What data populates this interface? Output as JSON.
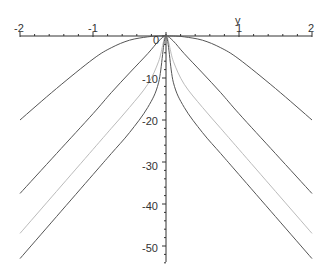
{
  "chart_data": {
    "type": "line",
    "title": "",
    "xlabel": "",
    "ylabel": "y",
    "xlim": [
      -2,
      2
    ],
    "ylim": [
      -53,
      1
    ],
    "x_ticks": [
      "-2",
      "-1",
      "1",
      "2"
    ],
    "y_ticks": [
      "0",
      "-10",
      "-20",
      "-30",
      "-40",
      "-50"
    ],
    "grid": false,
    "legend": null,
    "x": [
      -2,
      -1.5,
      -1,
      -0.75,
      -0.5,
      -0.25,
      -0.1,
      0,
      0.1,
      0.25,
      0.5,
      0.75,
      1,
      1.5,
      2
    ],
    "series": [
      {
        "name": "curve-1",
        "color": "#555555",
        "values": [
          -20,
          -12.5,
          -5.5,
          -2.8,
          -1.0,
          -0.2,
          0,
          0,
          0,
          -0.2,
          -1.0,
          -2.8,
          -5.5,
          -12.5,
          -20
        ]
      },
      {
        "name": "curve-2",
        "color": "#555555",
        "values": [
          -37.5,
          -28,
          -18.5,
          -13.5,
          -8.8,
          -4.2,
          -1.2,
          0,
          -1.2,
          -4.2,
          -8.8,
          -13.5,
          -18.5,
          -28,
          -37.5
        ]
      },
      {
        "name": "curve-3",
        "color": "#bbbbbb",
        "values": [
          -47,
          -37,
          -27,
          -22,
          -17,
          -11.5,
          -6,
          0,
          -6,
          -11.5,
          -17,
          -22,
          -27,
          -37,
          -47
        ]
      },
      {
        "name": "curve-4",
        "color": "#555555",
        "values": [
          -53,
          -43,
          -33,
          -28,
          -23,
          -17,
          -11,
          0,
          -11,
          -17,
          -23,
          -28,
          -33,
          -43,
          -53
        ]
      }
    ]
  },
  "labels": {
    "x_minus2": "-2",
    "x_minus1": "-1",
    "x_1": "1",
    "x_2": "2",
    "y_axis_name": "y",
    "y_0": "0",
    "y_minus10": "-10",
    "y_minus20": "-20",
    "y_minus30": "-30",
    "y_minus40": "-40",
    "y_minus50": "-50"
  }
}
